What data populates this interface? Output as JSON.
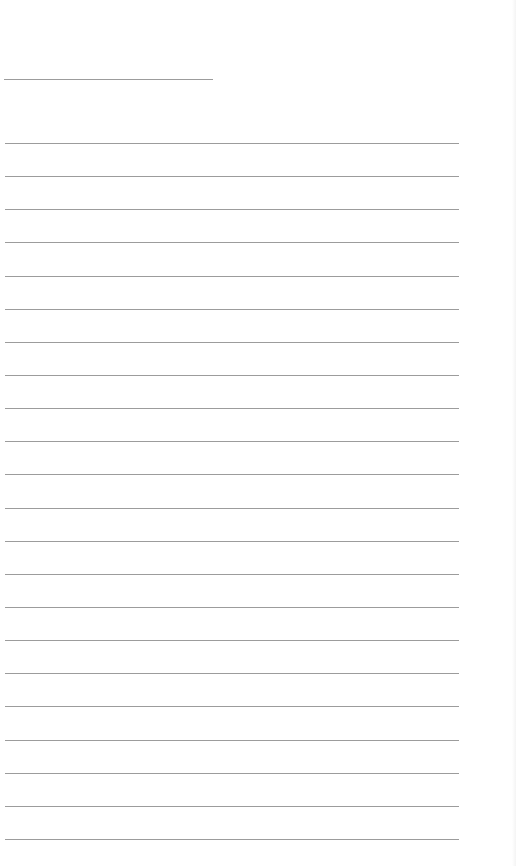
{
  "page": {
    "type": "lined-paper",
    "background_color": "#ffffff",
    "line_color": "#9c9c9c",
    "header_line": {
      "x": 4,
      "y": 79,
      "width": 209
    },
    "ruled_lines": {
      "count": 22,
      "x": 5,
      "width": 454,
      "first_y": 143,
      "spacing": 33.14
    },
    "text": []
  }
}
